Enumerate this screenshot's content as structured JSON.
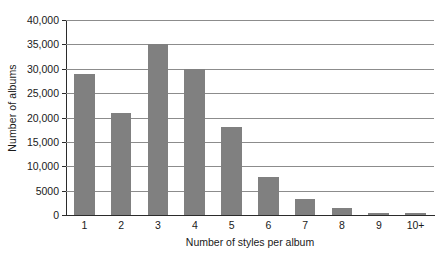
{
  "chart_data": {
    "type": "bar",
    "title": "",
    "xlabel": "Number of styles per album",
    "ylabel": "Number of albums",
    "categories": [
      "1",
      "2",
      "3",
      "4",
      "5",
      "6",
      "7",
      "8",
      "9",
      "10+"
    ],
    "values": [
      29000,
      21000,
      35000,
      30000,
      18000,
      7800,
      3300,
      1500,
      500,
      500
    ],
    "ylim": [
      0,
      40000
    ],
    "ytick_values": [
      0,
      5000,
      10000,
      15000,
      20000,
      25000,
      30000,
      35000,
      40000
    ],
    "ytick_labels": [
      "0",
      "5000",
      "10,000",
      "15,000",
      "20,000",
      "25,000",
      "30,000",
      "35,000",
      "40,000"
    ],
    "grid": "horizontal",
    "legend": "none",
    "bar_color": "#808080",
    "gridline_color": "#8c8c8c",
    "axis_color": "#2b2b2b",
    "background_color": "#ffffff"
  }
}
